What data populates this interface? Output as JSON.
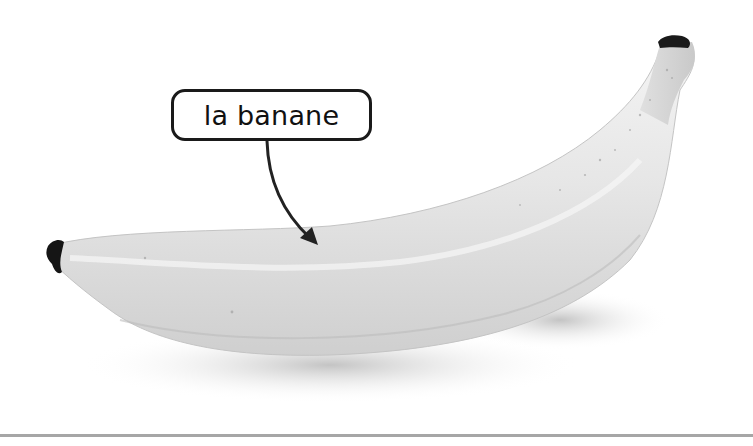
{
  "image": {
    "subject": "banana",
    "style": "grayscale photograph",
    "background_color": "#ffffff"
  },
  "label": {
    "text": "la banane",
    "border_color": "#1a1a1a",
    "text_color": "#111111"
  },
  "arrow": {
    "color": "#222222",
    "points_to": "banana"
  },
  "bottom_rule_color": "#a6a6a6"
}
